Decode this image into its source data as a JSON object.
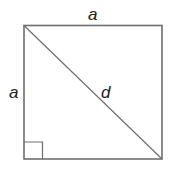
{
  "diagram": {
    "labels": {
      "top_side": "a",
      "left_side": "a",
      "diagonal": "d"
    },
    "colors": {
      "stroke": "#6e6e6e",
      "text": "#222222",
      "background": "#ffffff"
    }
  }
}
